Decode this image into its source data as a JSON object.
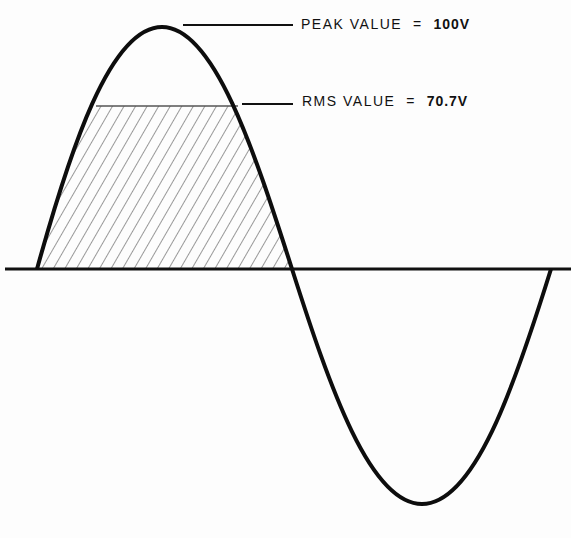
{
  "diagram": {
    "type": "sine-wave-rms-illustration",
    "labels": {
      "peak_text": "PEAK VALUE",
      "peak_eq": "=",
      "peak_value": "100V",
      "rms_text": "RMS VALUE",
      "rms_eq": "=",
      "rms_value": "70.7V"
    },
    "colors": {
      "curve": "#0d0d0d",
      "axis": "#111111",
      "hatch": "#555555",
      "background": "#fdfdfd"
    }
  }
}
